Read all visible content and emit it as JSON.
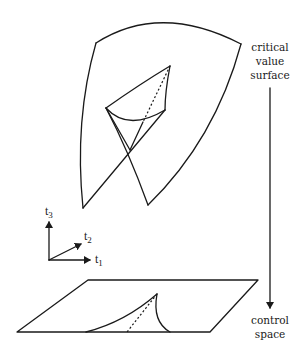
{
  "diagram": {
    "labels": {
      "critical_value_surface": [
        "critical",
        "value",
        "surface"
      ],
      "control_space": [
        "control",
        "space"
      ]
    },
    "axes": {
      "t1": {
        "base": "t",
        "sub": "1"
      },
      "t2": {
        "base": "t",
        "sub": "2"
      },
      "t3": {
        "base": "t",
        "sub": "3"
      }
    },
    "colors": {
      "stroke": "#1a1a1a",
      "background": "#ffffff"
    }
  }
}
